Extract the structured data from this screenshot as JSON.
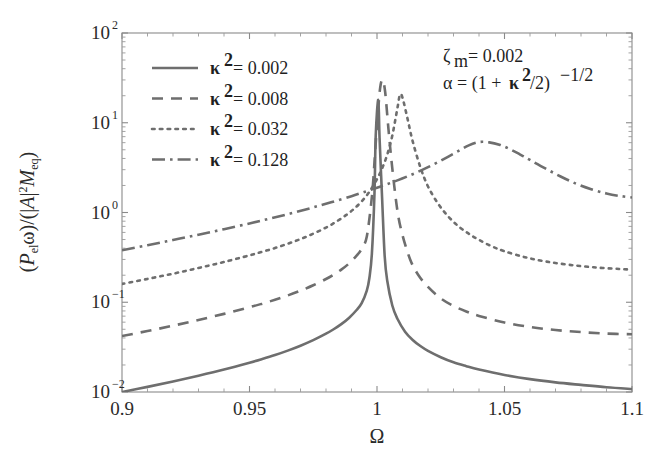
{
  "chart_data": {
    "type": "line",
    "title": "",
    "xlabel": "Ω",
    "ylabel": "(Pₑₗω)/(|A|²Mₑq)",
    "xlim": [
      0.9,
      1.1
    ],
    "ylim": [
      0.01,
      100
    ],
    "yscale": "log",
    "xscale": "linear",
    "grid": false,
    "legend_position": "upper-left",
    "xticks": [
      "0.9",
      "0.95",
      "1",
      "1.05",
      "1.1"
    ],
    "xtick_values": [
      0.9,
      0.95,
      1,
      1.05,
      1.1
    ],
    "yticks": [
      "10²",
      "10¹",
      "10⁰",
      "10⁻¹",
      "10⁻²"
    ],
    "ytick_values": [
      100,
      10,
      1,
      0.1,
      0.01
    ],
    "annotations": [
      {
        "text": "ζₘ = 0.002",
        "position": "upper-right"
      },
      {
        "text": "α = (1 + κ²/2)⁻¹ᐟ²",
        "position": "upper-right"
      }
    ],
    "series": [
      {
        "name": "κ² = 0.002",
        "kappa_sq": 0.002,
        "style": "solid",
        "peak_x": 1.0005,
        "peak_y": 18.0,
        "x": [
          0.9,
          0.91,
          0.92,
          0.93,
          0.94,
          0.95,
          0.955,
          0.96,
          0.965,
          0.97,
          0.975,
          0.98,
          0.983,
          0.986,
          0.989,
          0.992,
          0.994,
          0.996,
          0.997,
          0.998,
          0.999,
          0.9995,
          1.0005,
          1.001,
          1.002,
          1.003,
          1.004,
          1.006,
          1.008,
          1.011,
          1.014,
          1.017,
          1.02,
          1.025,
          1.03,
          1.035,
          1.04,
          1.05,
          1.06,
          1.07,
          1.08,
          1.09,
          1.1
        ],
        "y": [
          0.01,
          0.0114,
          0.0131,
          0.0152,
          0.0178,
          0.0212,
          0.0233,
          0.0258,
          0.0289,
          0.0328,
          0.0378,
          0.0446,
          0.05,
          0.057,
          0.0668,
          0.082,
          0.098,
          0.135,
          0.185,
          0.35,
          1.6,
          7.2,
          18.0,
          6.8,
          1.45,
          0.33,
          0.175,
          0.092,
          0.0655,
          0.047,
          0.038,
          0.0325,
          0.0287,
          0.0244,
          0.0214,
          0.0194,
          0.0178,
          0.0155,
          0.0139,
          0.0128,
          0.012,
          0.0113,
          0.0108
        ]
      },
      {
        "name": "κ² = 0.008",
        "kappa_sq": 0.008,
        "style": "dashed",
        "peak_x": 1.0022,
        "peak_y": 30.0,
        "x": [
          0.9,
          0.91,
          0.92,
          0.93,
          0.94,
          0.95,
          0.955,
          0.96,
          0.965,
          0.97,
          0.975,
          0.98,
          0.983,
          0.986,
          0.989,
          0.992,
          0.994,
          0.996,
          0.998,
          0.999,
          1.0,
          1.0012,
          1.0022,
          1.0032,
          1.0045,
          1.006,
          1.008,
          1.01,
          1.013,
          1.016,
          1.02,
          1.025,
          1.03,
          1.035,
          1.04,
          1.05,
          1.06,
          1.07,
          1.08,
          1.09,
          1.1
        ],
        "y": [
          0.042,
          0.0478,
          0.0548,
          0.0635,
          0.0742,
          0.088,
          0.0965,
          0.1065,
          0.119,
          0.1345,
          0.1545,
          0.1815,
          0.203,
          0.231,
          0.27,
          0.33,
          0.395,
          0.54,
          1.5,
          3.6,
          9.5,
          24.0,
          30.0,
          22.0,
          8.5,
          3.1,
          1.05,
          0.56,
          0.3,
          0.205,
          0.148,
          0.1105,
          0.091,
          0.079,
          0.0705,
          0.0595,
          0.053,
          0.049,
          0.0465,
          0.0448,
          0.044
        ]
      },
      {
        "name": "κ² = 0.032",
        "kappa_sq": 0.032,
        "style": "dotted",
        "peak_x": 1.009,
        "peak_y": 20.5,
        "x": [
          0.9,
          0.91,
          0.92,
          0.93,
          0.94,
          0.95,
          0.955,
          0.96,
          0.965,
          0.97,
          0.975,
          0.98,
          0.984,
          0.988,
          0.991,
          0.994,
          0.997,
          1.0,
          1.002,
          1.004,
          1.006,
          1.008,
          1.009,
          1.01,
          1.012,
          1.014,
          1.017,
          1.02,
          1.024,
          1.028,
          1.032,
          1.036,
          1.04,
          1.045,
          1.05,
          1.058,
          1.066,
          1.075,
          1.085,
          1.095,
          1.1
        ],
        "y": [
          0.16,
          0.182,
          0.208,
          0.241,
          0.281,
          0.333,
          0.365,
          0.402,
          0.449,
          0.506,
          0.58,
          0.68,
          0.79,
          0.94,
          1.1,
          1.33,
          1.7,
          2.35,
          3.1,
          4.4,
          7.2,
          14.5,
          20.5,
          19.0,
          11.0,
          6.2,
          3.2,
          1.95,
          1.25,
          0.9,
          0.7,
          0.58,
          0.495,
          0.42,
          0.37,
          0.318,
          0.285,
          0.262,
          0.245,
          0.235,
          0.231
        ]
      },
      {
        "name": "κ² = 0.128",
        "kappa_sq": 0.128,
        "style": "dashdot",
        "peak_x": 1.036,
        "peak_y": 6.1,
        "x": [
          0.9,
          0.91,
          0.92,
          0.93,
          0.94,
          0.95,
          0.958,
          0.966,
          0.974,
          0.982,
          0.99,
          0.996,
          1.0,
          1.004,
          1.008,
          1.012,
          1.016,
          1.02,
          1.024,
          1.028,
          1.032,
          1.036,
          1.04,
          1.044,
          1.048,
          1.052,
          1.056,
          1.06,
          1.066,
          1.072,
          1.078,
          1.084,
          1.09,
          1.095,
          1.1
        ],
        "y": [
          0.38,
          0.432,
          0.494,
          0.566,
          0.652,
          0.755,
          0.855,
          0.975,
          1.12,
          1.3,
          1.52,
          1.73,
          1.89,
          2.07,
          2.28,
          2.53,
          2.83,
          3.2,
          3.65,
          4.2,
          4.85,
          5.6,
          6.1,
          6.05,
          5.7,
          5.1,
          4.45,
          3.85,
          3.1,
          2.52,
          2.1,
          1.82,
          1.63,
          1.53,
          1.47
        ]
      }
    ]
  },
  "legend": {
    "entries": [
      {
        "symbol": "κ",
        "exponent": "2",
        "equals": "= 0.002",
        "style": "solid"
      },
      {
        "symbol": "κ",
        "exponent": "2",
        "equals": "= 0.008",
        "style": "dashed"
      },
      {
        "symbol": "κ",
        "exponent": "2",
        "equals": "= 0.032",
        "style": "dotted"
      },
      {
        "symbol": "κ",
        "exponent": "2",
        "equals": "= 0.128",
        "style": "dashdot"
      }
    ]
  },
  "annotation_block": {
    "line1_sym": "ζ",
    "line1_sub": "m",
    "line1_val": "= 0.002",
    "line2_sym": "α",
    "line2_eq": "= (1 + ",
    "line2_kappa": "κ",
    "line2_kexp": "2",
    "line2_tail": "/2)",
    "line2_exp": "−1/2"
  },
  "axes": {
    "x_title": "Ω",
    "y_title_parts": {
      "p1": "(",
      "p2": "P",
      "p2sub": "el",
      "p3": "ω)/(|",
      "p4": "A",
      "p5": "|",
      "p5sup": "2",
      "p6": "M",
      "p6sub": "eq",
      "p7": ")"
    },
    "x_tick_labels": [
      "0.9",
      "0.95",
      "1",
      "1.05",
      "1.1"
    ],
    "y_tick_mantissa": "10",
    "y_tick_exponents": [
      "2",
      "1",
      "0",
      "−1",
      "−2"
    ]
  },
  "colors": {
    "curve": "#6e6e6e",
    "axis": "#8a8a8a",
    "text": "#2b2b2b",
    "background": "#ffffff"
  }
}
